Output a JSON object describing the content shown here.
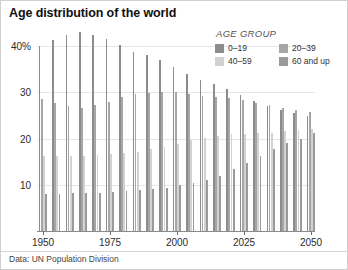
{
  "chart_title": "Age distribution of the world",
  "source_note": "Data: UN Population Division",
  "legend": {
    "title": "AGE GROUP",
    "items": [
      {
        "label": "0–19",
        "color": "#8c8c8c"
      },
      {
        "label": "20–39",
        "color": "#a6a6a6"
      },
      {
        "label": "40–59",
        "color": "#d2d2d2"
      },
      {
        "label": "60 and up",
        "color": "#9a9a9a"
      }
    ]
  },
  "axes": {
    "y_ticks": [
      "40%",
      "30",
      "20",
      "10"
    ],
    "y_tick_values": [
      40,
      30,
      20,
      10
    ],
    "x_ticks": [
      "1950",
      "1975",
      "2000",
      "2025",
      "2050"
    ],
    "x_tick_values": [
      1950,
      1975,
      2000,
      2025,
      2050
    ]
  },
  "chart_data": {
    "type": "bar",
    "title": "Age distribution of the world",
    "subtitle": "",
    "xlabel": "",
    "ylabel": "",
    "ylim": [
      0,
      45
    ],
    "xlim": [
      1950,
      2050
    ],
    "grid": true,
    "legend_position": "top-right",
    "units": "percent of world population",
    "categories": [
      1950,
      1955,
      1960,
      1965,
      1970,
      1975,
      1980,
      1985,
      1990,
      1995,
      2000,
      2005,
      2010,
      2015,
      2020,
      2025,
      2030,
      2035,
      2040,
      2045,
      2050
    ],
    "series": [
      {
        "name": "0–19",
        "color": "#8c8c8c",
        "values": [
          40.0,
          41.3,
          42.3,
          43.0,
          42.4,
          41.6,
          40.2,
          38.8,
          38.0,
          37.0,
          35.5,
          34.0,
          32.7,
          31.8,
          30.7,
          29.4,
          28.2,
          27.1,
          26.2,
          25.5,
          24.9
        ]
      },
      {
        "name": "20–39",
        "color": "#a6a6a6",
        "values": [
          28.6,
          27.8,
          27.0,
          26.6,
          27.2,
          28.0,
          29.0,
          29.6,
          29.9,
          30.1,
          30.0,
          29.6,
          29.2,
          29.0,
          28.7,
          28.3,
          27.8,
          27.2,
          26.6,
          26.1,
          25.7
        ]
      },
      {
        "name": "40–59",
        "color": "#d2d2d2",
        "values": [
          16.3,
          16.2,
          16.2,
          16.3,
          16.4,
          16.6,
          16.8,
          17.2,
          17.7,
          18.2,
          18.9,
          19.6,
          20.2,
          20.6,
          20.9,
          21.0,
          21.1,
          21.3,
          21.6,
          21.9,
          22.1
        ]
      },
      {
        "name": "60 and up",
        "color": "#9a9a9a",
        "values": [
          8.1,
          8.1,
          8.2,
          8.2,
          8.3,
          8.5,
          8.6,
          8.8,
          9.1,
          9.4,
          9.9,
          10.4,
          11.0,
          12.0,
          13.4,
          14.8,
          16.3,
          17.7,
          19.0,
          20.0,
          21.1
        ]
      }
    ]
  }
}
